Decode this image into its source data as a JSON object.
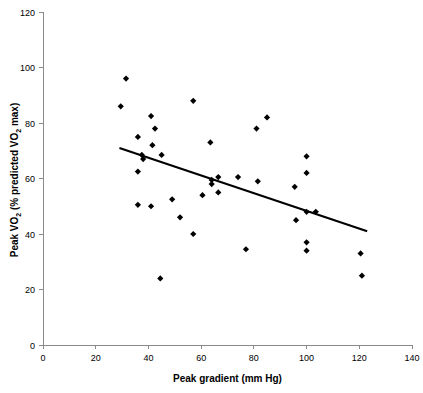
{
  "chart_data": {
    "type": "scatter",
    "title": "",
    "subtitle": "",
    "xlabel": "Peak gradient (mm Hg)",
    "ylabel": "Peak VO2 (% predicted VO2 max)",
    "ylabel_parts": {
      "a": "Peak VO",
      "sub1": "2",
      "b": " (% predicted VO",
      "sub2": "2",
      "c": " max)"
    },
    "xlim": [
      0,
      140
    ],
    "ylim": [
      0,
      120
    ],
    "xticks": [
      0,
      20,
      40,
      60,
      80,
      100,
      120,
      140
    ],
    "yticks": [
      0,
      20,
      40,
      60,
      80,
      100,
      120
    ],
    "xtick_labels": [
      "0",
      "20",
      "40",
      "60",
      "80",
      "100",
      "120",
      "140"
    ],
    "ytick_labels": [
      "0",
      "20",
      "40",
      "60",
      "80",
      "100",
      "120"
    ],
    "grid": false,
    "legend": false,
    "legend_position": "none",
    "marker": "diamond",
    "marker_color": "#000000",
    "marker_size": 5,
    "axis_color": "#8a8a8a",
    "series": [
      {
        "name": "Patients",
        "points": [
          {
            "x": 29.5,
            "y": 86
          },
          {
            "x": 31.5,
            "y": 96
          },
          {
            "x": 36.0,
            "y": 75
          },
          {
            "x": 36.0,
            "y": 62.5
          },
          {
            "x": 36.0,
            "y": 50.5
          },
          {
            "x": 37.5,
            "y": 68.5
          },
          {
            "x": 38.0,
            "y": 67
          },
          {
            "x": 41.0,
            "y": 82.5
          },
          {
            "x": 41.0,
            "y": 50
          },
          {
            "x": 41.5,
            "y": 72
          },
          {
            "x": 42.5,
            "y": 78
          },
          {
            "x": 44.5,
            "y": 24
          },
          {
            "x": 45.0,
            "y": 68.5
          },
          {
            "x": 49.0,
            "y": 52.5
          },
          {
            "x": 52.0,
            "y": 46
          },
          {
            "x": 57.0,
            "y": 88
          },
          {
            "x": 57.0,
            "y": 40
          },
          {
            "x": 60.5,
            "y": 54
          },
          {
            "x": 63.5,
            "y": 73
          },
          {
            "x": 64.0,
            "y": 59.5
          },
          {
            "x": 64.0,
            "y": 58
          },
          {
            "x": 66.5,
            "y": 60.5
          },
          {
            "x": 66.5,
            "y": 55
          },
          {
            "x": 74.0,
            "y": 60.5
          },
          {
            "x": 77.0,
            "y": 34.5
          },
          {
            "x": 81.0,
            "y": 78
          },
          {
            "x": 81.5,
            "y": 59
          },
          {
            "x": 85.0,
            "y": 82
          },
          {
            "x": 95.5,
            "y": 57
          },
          {
            "x": 96.0,
            "y": 45
          },
          {
            "x": 100.0,
            "y": 68
          },
          {
            "x": 100.0,
            "y": 62
          },
          {
            "x": 100.0,
            "y": 48
          },
          {
            "x": 100.0,
            "y": 37
          },
          {
            "x": 100.0,
            "y": 34
          },
          {
            "x": 103.5,
            "y": 48
          },
          {
            "x": 120.5,
            "y": 33
          },
          {
            "x": 121.0,
            "y": 25
          }
        ]
      }
    ],
    "trend_line": {
      "name": "regression-line",
      "x_start": 29,
      "y_start": 71,
      "x_end": 123,
      "y_end": 41,
      "color": "#000000"
    }
  }
}
